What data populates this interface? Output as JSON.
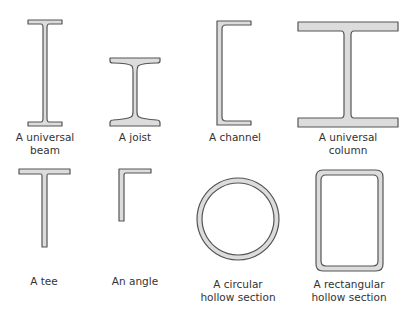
{
  "colors": {
    "fill": "#dcdcdc",
    "stroke": "#555555",
    "text": "#333333"
  },
  "sections": [
    {
      "id": "universal-beam",
      "label_line1": "A universal",
      "label_line2": "beam"
    },
    {
      "id": "joist",
      "label_line1": "A joist",
      "label_line2": ""
    },
    {
      "id": "channel",
      "label_line1": "A channel",
      "label_line2": ""
    },
    {
      "id": "universal-column",
      "label_line1": "A universal",
      "label_line2": "column"
    },
    {
      "id": "tee",
      "label_line1": "A tee",
      "label_line2": ""
    },
    {
      "id": "angle",
      "label_line1": "An angle",
      "label_line2": ""
    },
    {
      "id": "circular-hollow-section",
      "label_line1": "A circular",
      "label_line2": "hollow section"
    },
    {
      "id": "rectangular-hollow-section",
      "label_line1": "A rectangular",
      "label_line2": "hollow section"
    }
  ]
}
